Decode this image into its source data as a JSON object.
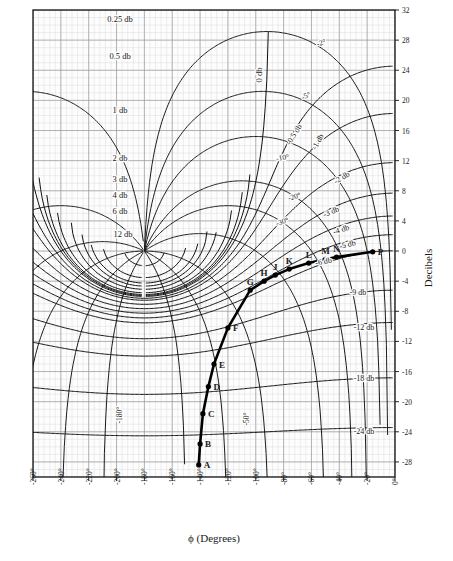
{
  "chart_data": {
    "type": "line",
    "title": "",
    "chart_kind": "nichols-chart",
    "xlabel": "ϕ (Degrees)",
    "ylabel": "Decibels",
    "xlim": [
      -260,
      0
    ],
    "ylim": [
      -30,
      32
    ],
    "grid": true,
    "legend": "none",
    "xticks": [
      "-260°",
      "-240°",
      "-220°",
      "-200°",
      "-180°",
      "-160°",
      "-140°",
      "-120°",
      "-100°",
      "-80°",
      "-60°",
      "-40°",
      "-20°",
      "0°"
    ],
    "xtick_values": [
      -260,
      -240,
      -220,
      -200,
      -180,
      -160,
      -140,
      -120,
      -100,
      -80,
      -60,
      -40,
      -20,
      0
    ],
    "yticks": [
      "32",
      "28",
      "24",
      "20",
      "16",
      "12",
      "8",
      "4",
      "0",
      "-4",
      "-8",
      "-12",
      "-16",
      "-20",
      "-24",
      "-28"
    ],
    "ytick_values": [
      32,
      28,
      24,
      20,
      16,
      12,
      8,
      4,
      0,
      -4,
      -8,
      -12,
      -16,
      -20,
      -24,
      -28
    ],
    "series": [
      {
        "name": "open-loop frequency response",
        "point_labels": [
          "A",
          "B",
          "C",
          "D",
          "E",
          "F",
          "G",
          "H",
          "J",
          "K",
          "L",
          "M",
          "N",
          "P"
        ],
        "x": [
          -141,
          -140,
          -138,
          -134,
          -130,
          -120,
          -104,
          -94,
          -86,
          -76,
          -62,
          -50,
          -42,
          -16
        ],
        "y": [
          -28.4,
          -25.6,
          -21.6,
          -18.0,
          -15.0,
          -10.2,
          -5.2,
          -4.0,
          -3.2,
          -2.4,
          -1.6,
          -1.1,
          -0.8,
          -0.1
        ]
      }
    ],
    "m_contours_positive": [
      "0.25 db",
      "0.5 db",
      "1 db",
      "2 db",
      "3 db",
      "4 db",
      "6 db",
      "12 db"
    ],
    "m_contours_zero": [
      "0 db"
    ],
    "m_contours_negative": [
      "-0.5 db",
      "-1 db",
      "-2 db",
      "-3 db",
      "-4 db",
      "-5 db",
      "-6 db",
      "-9 db",
      "-12 db",
      "-18 db",
      "-24 db"
    ],
    "n_contours": [
      "-2°",
      "-5°",
      "-10°",
      "-20°",
      "-30°",
      "-50°",
      "-180°"
    ]
  },
  "labels": {
    "xaxis_title": "ϕ (Degrees)",
    "yaxis_title": "Decibels",
    "m_pos": [
      {
        "text": "0.25 db",
        "x": 120,
        "y": 22
      },
      {
        "text": "0.5 db",
        "x": 120,
        "y": 59
      },
      {
        "text": "1 db",
        "x": 120,
        "y": 113
      },
      {
        "text": "2 db",
        "x": 120,
        "y": 161
      },
      {
        "text": "3 db",
        "x": 120,
        "y": 182
      },
      {
        "text": "4 db",
        "x": 120,
        "y": 198
      },
      {
        "text": "6 db",
        "x": 120,
        "y": 214
      },
      {
        "text": "12 db",
        "x": 123,
        "y": 237
      }
    ],
    "m_zero": {
      "text": "0 db",
      "x": 262,
      "y": 75
    },
    "m_neg": [
      {
        "text": "-0.5 db",
        "x": 296,
        "y": 136,
        "rot": -58
      },
      {
        "text": "-1 db",
        "x": 320,
        "y": 143,
        "rot": -62
      },
      {
        "text": "-2 db",
        "x": 343,
        "y": 180,
        "rot": -30
      },
      {
        "text": "-3 db",
        "x": 332,
        "y": 214,
        "rot": -22
      },
      {
        "text": "-4 db",
        "x": 342,
        "y": 232,
        "rot": -18
      },
      {
        "text": "-5 db",
        "x": 348,
        "y": 247,
        "rot": -14
      },
      {
        "text": "-6 db",
        "x": 324,
        "y": 264,
        "rot": -10
      },
      {
        "text": "-9 db",
        "x": 358,
        "y": 295,
        "rot": 0
      },
      {
        "text": "-12 db",
        "x": 364,
        "y": 330,
        "rot": 0
      },
      {
        "text": "-18 db",
        "x": 364,
        "y": 381,
        "rot": 0
      },
      {
        "text": "-24 db",
        "x": 364,
        "y": 434,
        "rot": 0
      }
    ],
    "n_labels": [
      {
        "text": "-2°",
        "x": 322,
        "y": 45,
        "rot": -18
      },
      {
        "text": "-5°",
        "x": 307,
        "y": 98,
        "rot": -24
      },
      {
        "text": "-10°",
        "x": 283,
        "y": 160,
        "rot": -8
      },
      {
        "text": "-20°",
        "x": 295,
        "y": 199,
        "rot": -16
      },
      {
        "text": "-30°",
        "x": 283,
        "y": 224,
        "rot": -18
      },
      {
        "text": "-50°",
        "x": 249,
        "y": 419,
        "rot": -90
      },
      {
        "text": "-180°",
        "x": 122,
        "y": 415,
        "rot": -90
      }
    ],
    "data_points": [
      {
        "id": "A",
        "px": 190,
        "py": 471
      },
      {
        "id": "B",
        "px": 192,
        "py": 450
      },
      {
        "id": "C",
        "px": 196,
        "py": 421
      },
      {
        "id": "D",
        "px": 205,
        "py": 395
      },
      {
        "id": "E",
        "px": 213,
        "py": 372
      },
      {
        "id": "F",
        "px": 234,
        "py": 337
      },
      {
        "id": "G",
        "px": 268,
        "py": 300
      },
      {
        "id": "H",
        "px": 289,
        "py": 292
      },
      {
        "id": "J",
        "px": 305,
        "py": 287
      },
      {
        "id": "K",
        "px": 326,
        "py": 283
      },
      {
        "id": "L",
        "px": 356,
        "py": 277
      },
      {
        "id": "M",
        "px": 380,
        "py": 275
      },
      {
        "id": "N",
        "px": 396,
        "py": 273
      },
      {
        "id": "P",
        "px": 452,
        "py": 270
      }
    ]
  }
}
